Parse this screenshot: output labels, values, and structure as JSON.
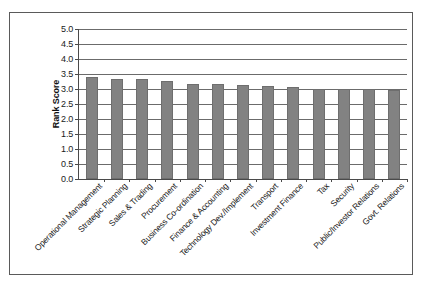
{
  "chart_data": {
    "type": "bar",
    "title": "",
    "xlabel": "",
    "ylabel": "Rank Score",
    "ylim": [
      0.0,
      5.0
    ],
    "ytick_labels": [
      "5.0",
      "4.5",
      "4.0",
      "3.5",
      "3.0",
      "2.5",
      "2.0",
      "1.5",
      "1.0",
      "0.5",
      "0.0"
    ],
    "ytick_values": [
      5.0,
      4.5,
      4.0,
      3.5,
      3.0,
      2.5,
      2.0,
      1.5,
      1.0,
      0.5,
      0.0
    ],
    "grid": true,
    "legend": "none",
    "bar_color": "#828282",
    "categories": [
      "Operational Management",
      "Strategic Planning",
      "Sales & Trading",
      "Procurement",
      "Business Co-ordination",
      "Finance & Accounting",
      "Technology Dev./Implement",
      "Transport",
      "Investment Finance",
      "Tax",
      "Security",
      "Public/Investor Relations",
      "Govt. Relations"
    ],
    "values": [
      3.4,
      3.32,
      3.32,
      3.27,
      3.17,
      3.17,
      3.15,
      3.1,
      3.08,
      3.0,
      3.0,
      3.0,
      2.97
    ]
  }
}
